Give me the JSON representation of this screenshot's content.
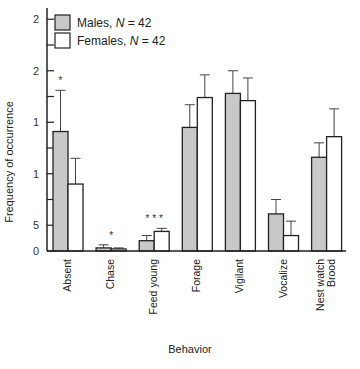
{
  "chart_data": {
    "type": "bar",
    "title": "",
    "xlabel": "Behavior",
    "ylabel": "Frequency of occurrence",
    "categories": [
      "Absent",
      "Chase",
      "Feed young",
      "Forage",
      "Vigilant",
      "Vocalize",
      "Nest watch Brood"
    ],
    "category_lines": [
      [
        "Absent"
      ],
      [
        "Chase"
      ],
      [
        "Feed young"
      ],
      [
        "Forage"
      ],
      [
        "Vigilant"
      ],
      [
        "Vocalize"
      ],
      [
        "Nest watch",
        "Brood"
      ]
    ],
    "significance": [
      "*",
      "*",
      "* * *",
      "",
      "",
      "",
      ""
    ],
    "y_ticks": [
      {
        "value": 0,
        "label": "0",
        "major": true
      },
      {
        "value": 2.5,
        "label": "5",
        "major": true
      },
      {
        "value": 5,
        "label": "",
        "major": false
      },
      {
        "value": 7.5,
        "label": "1",
        "major": true
      },
      {
        "value": 10,
        "label": "",
        "major": false
      },
      {
        "value": 12.5,
        "label": "1",
        "major": true
      },
      {
        "value": 15,
        "label": "",
        "major": false
      },
      {
        "value": 17.5,
        "label": "2",
        "major": true
      },
      {
        "value": 20,
        "label": "",
        "major": false
      },
      {
        "value": 22.5,
        "label": "2",
        "major": true
      }
    ],
    "ylim": [
      0,
      23
    ],
    "grid": false,
    "legend_position": "upper left",
    "series": [
      {
        "name": "Males, N = 42",
        "label_prefix": "Males, ",
        "label_n": "N",
        "label_suffix": " = 42",
        "color": "#c8c8c8",
        "values": [
          11.6,
          0.3,
          1.0,
          12.0,
          15.3,
          3.6,
          9.1
        ],
        "errors": [
          4.0,
          0.3,
          0.5,
          2.2,
          2.2,
          1.4,
          1.4
        ]
      },
      {
        "name": "Females, N = 42",
        "label_prefix": "Females, ",
        "label_n": "N",
        "label_suffix": " = 42",
        "color": "#ffffff",
        "values": [
          6.5,
          0.2,
          1.9,
          14.9,
          14.6,
          1.5,
          11.1
        ],
        "errors": [
          2.5,
          0.1,
          0.3,
          2.2,
          2.2,
          1.4,
          2.7
        ]
      }
    ]
  },
  "colors": {
    "axis": "#222222",
    "male_fill": "#c8c8c8",
    "female_fill": "#ffffff",
    "bar_stroke": "#222222",
    "error": "#444444"
  }
}
